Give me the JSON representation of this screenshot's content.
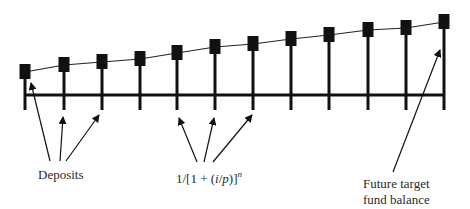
{
  "diagram": {
    "colors": {
      "ink": "#111111",
      "background": "#ffffff"
    },
    "timeline": {
      "y": 95,
      "x_start": 25,
      "x_end": 444,
      "periods": 12
    },
    "stems": [
      {
        "x": 25,
        "marker_y": 72
      },
      {
        "x": 64,
        "marker_y": 65
      },
      {
        "x": 102,
        "marker_y": 62
      },
      {
        "x": 140,
        "marker_y": 59
      },
      {
        "x": 177,
        "marker_y": 53
      },
      {
        "x": 215,
        "marker_y": 47
      },
      {
        "x": 253,
        "marker_y": 44
      },
      {
        "x": 291,
        "marker_y": 39
      },
      {
        "x": 329,
        "marker_y": 35
      },
      {
        "x": 368,
        "marker_y": 30
      },
      {
        "x": 406,
        "marker_y": 28
      },
      {
        "x": 444,
        "marker_y": 22
      }
    ],
    "labels": {
      "deposits": "Deposits",
      "discount_prefix": "1/[1 + (",
      "discount_i": "i",
      "discount_slash": "/",
      "discount_p": "p",
      "discount_suffix": ")]",
      "discount_exp": "n",
      "future_line1": "Future target",
      "future_line2": "fund balance"
    }
  }
}
